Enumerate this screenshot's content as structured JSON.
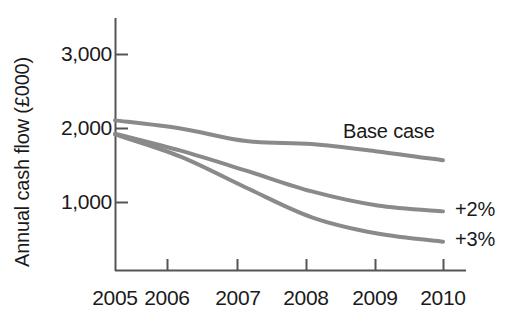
{
  "chart_data": {
    "type": "line",
    "title": "",
    "subtitle": "",
    "xlabel": "",
    "ylabel": "Annual cash flow (£000)",
    "x": [
      2005,
      2006,
      2007,
      2008,
      2009,
      2010
    ],
    "xtick_labels": [
      "2005",
      "2006",
      "2007",
      "2008",
      "2009",
      "2010"
    ],
    "ytick_labels": [
      "1,000",
      "2,000",
      "3,000"
    ],
    "yticks": [
      1000,
      2000,
      3000
    ],
    "xlim": [
      2005,
      2010
    ],
    "ylim": [
      0,
      3300
    ],
    "grid": false,
    "legend_position": "inline-right",
    "line_color": "#8a8a8a",
    "line_width": 4,
    "axis_color": "#555555",
    "text_color": "#1a1a1a",
    "background": "#ffffff",
    "series": [
      {
        "name": "Base case",
        "label": "Base case",
        "label_placement": "above-line-right",
        "values": [
          2110,
          2000,
          1830,
          1790,
          1690,
          1570
        ]
      },
      {
        "name": "+2%",
        "label": "+2%",
        "label_placement": "end-right",
        "values": [
          1930,
          1700,
          1430,
          1150,
          960,
          880
        ]
      },
      {
        "name": "+3%",
        "label": "+3%",
        "label_placement": "end-right",
        "values": [
          1920,
          1620,
          1200,
          800,
          580,
          470
        ]
      }
    ]
  },
  "axes": {
    "y_axis_title": "Annual cash flow (£000)",
    "y_tick_1": "1,000",
    "y_tick_2": "2,000",
    "y_tick_3": "3,000",
    "x_tick_1": "2005",
    "x_tick_2": "2006",
    "x_tick_3": "2007",
    "x_tick_4": "2008",
    "x_tick_5": "2009",
    "x_tick_6": "2010"
  },
  "labels": {
    "base_case": "Base case",
    "plus_two": "+2%",
    "plus_three": "+3%"
  }
}
